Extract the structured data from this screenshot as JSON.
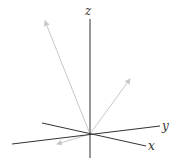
{
  "diagram": {
    "type": "3d-axes-vectors",
    "axes": [
      {
        "name": "z",
        "label": "z"
      },
      {
        "name": "y",
        "label": "y"
      },
      {
        "name": "x",
        "label": "x"
      }
    ],
    "vectors": [
      {
        "name": "vector-upper-left"
      },
      {
        "name": "vector-upper-right"
      },
      {
        "name": "vector-lower-left"
      }
    ],
    "colors": {
      "axis": "#333333",
      "vector": "#c8c8c8"
    }
  }
}
